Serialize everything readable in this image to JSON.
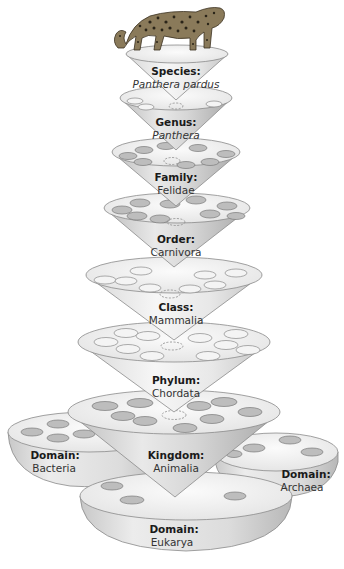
{
  "diagram": {
    "levels": [
      {
        "rank": "Species:",
        "name": "Panthera pardus",
        "italic": true
      },
      {
        "rank": "Genus:",
        "name": "Panthera",
        "italic": true
      },
      {
        "rank": "Family:",
        "name": "Felidae",
        "italic": false
      },
      {
        "rank": "Order:",
        "name": "Carnivora",
        "italic": false
      },
      {
        "rank": "Class:",
        "name": "Mammalia",
        "italic": false
      },
      {
        "rank": "Phylum:",
        "name": "Chordata",
        "italic": false
      },
      {
        "rank": "Kingdom:",
        "name": "Animalia",
        "italic": false
      }
    ],
    "domains": [
      {
        "rank": "Domain:",
        "name": "Bacteria"
      },
      {
        "rank": "Domain:",
        "name": "Archaea"
      },
      {
        "rank": "Domain:",
        "name": "Eukarya"
      }
    ],
    "colors": {
      "cone_light": "#f4f4f4",
      "cone_dark": "#a9a9a9",
      "hole_fill": "#bdbdbd",
      "stroke": "#8a8a8a"
    }
  }
}
